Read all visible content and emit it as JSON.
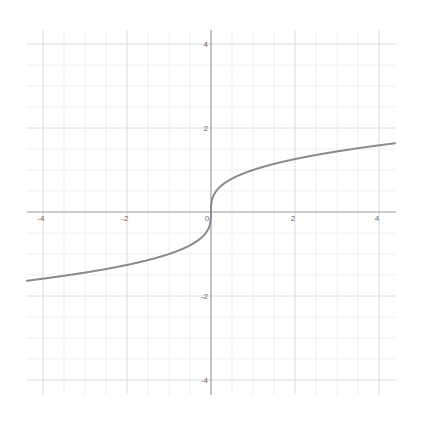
{
  "chart_data": {
    "type": "line",
    "title": "",
    "xlabel": "",
    "ylabel": "",
    "function": "y = cbrt(x)",
    "xlim": [
      -4.4,
      4.4
    ],
    "ylim": [
      -4.4,
      4.4
    ],
    "grid": true,
    "x_ticks": [
      -4,
      -2,
      0,
      2,
      4
    ],
    "y_ticks": [
      -4,
      -2,
      2,
      4
    ],
    "x_tick_labels": [
      "-4",
      "-2",
      "0",
      "2",
      "4"
    ],
    "y_tick_labels": [
      "-4",
      "-2",
      "2",
      "4"
    ],
    "series": [
      {
        "name": "cube root",
        "x": [
          -4.4,
          -4,
          -3,
          -2,
          -1,
          -0.5,
          -0.1,
          -0.01,
          0,
          0.01,
          0.1,
          0.5,
          1,
          2,
          3,
          4,
          4.4
        ],
        "y": [
          -1.64,
          -1.59,
          -1.44,
          -1.26,
          -1.0,
          -0.79,
          -0.46,
          -0.22,
          0,
          0.22,
          0.46,
          0.79,
          1.0,
          1.26,
          1.44,
          1.59,
          1.64
        ]
      }
    ],
    "legend": null
  },
  "style": {
    "axis_color": "#9a9a9a",
    "grid_major_color": "#dcdcdc",
    "grid_minor_color": "#efefef",
    "curve_color": "#8a8a8a"
  }
}
